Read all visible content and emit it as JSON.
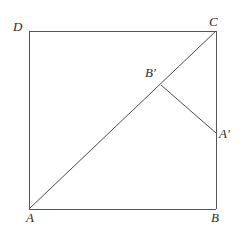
{
  "figure": {
    "caption": "",
    "canvas": {
      "width": 247,
      "height": 242
    },
    "style": {
      "background_color": "#ffffff",
      "line_color": "#555555",
      "diagonal_color": "#4a4a4a",
      "label_color": "#2b2b2b",
      "line_width": 1
    },
    "points": {
      "A": {
        "label": "A",
        "x": 29,
        "y": 209
      },
      "B": {
        "label": "B",
        "x": 216,
        "y": 209
      },
      "C": {
        "label": "C",
        "x": 216,
        "y": 31
      },
      "D": {
        "label": "D",
        "x": 29,
        "y": 31
      },
      "Bp": {
        "label": "B′",
        "x": 161,
        "y": 85
      },
      "Ap": {
        "label": "A′",
        "x": 216,
        "y": 133
      }
    },
    "segments": [
      {
        "name": "side-DC-top",
        "from": "D",
        "to": "C"
      },
      {
        "name": "side-AD-left",
        "from": "A",
        "to": "D"
      },
      {
        "name": "side-AB-bottom",
        "from": "A",
        "to": "B"
      },
      {
        "name": "side-BC-right",
        "from": "B",
        "to": "C"
      },
      {
        "name": "diagonal-AC",
        "from": "A",
        "to": "C"
      },
      {
        "name": "fold-Bp-Ap",
        "from": "Bp",
        "to": "Ap"
      }
    ]
  }
}
